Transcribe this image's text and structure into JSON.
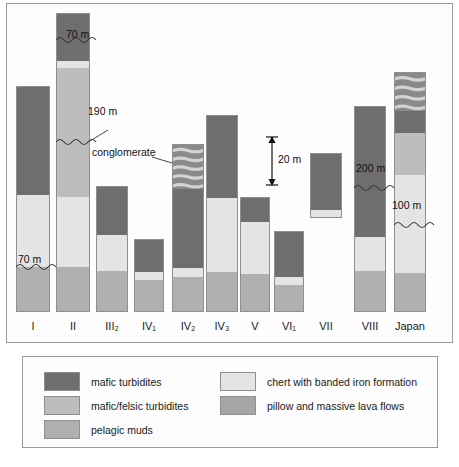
{
  "figure": {
    "type": "stratigraphic-column-diagram",
    "background": "#ffffff",
    "frame_border": "#9a9a9a"
  },
  "colors": {
    "mafic_turbidites": "#6e6e6e",
    "mafic_felsic_turbidites": "#bdbdbd",
    "pelagic_muds": "#b0b0b0",
    "chert_bif": "#e4e4e4",
    "pillow_lava": "#a6a6a6",
    "conglomerate_dark": "#8a8a8a",
    "conglomerate_light": "#d7d7d7",
    "outline": "#8f8f8f",
    "text": "#1a1a1a"
  },
  "legend": {
    "items": [
      {
        "label": "mafic turbidites",
        "color": "#6e6e6e",
        "key": "mafic_turbidites"
      },
      {
        "label": "mafic/felsic turbidites",
        "color": "#bdbdbd",
        "key": "mafic_felsic_turbidites"
      },
      {
        "label": "pelagic muds",
        "color": "#b0b0b0",
        "key": "pelagic_muds"
      },
      {
        "label": "chert with banded iron formation",
        "color": "#e4e4e4",
        "key": "chert_bif"
      },
      {
        "label": "pillow and massive lava flows",
        "color": "#a6a6a6",
        "key": "pillow_lava"
      }
    ]
  },
  "scale": {
    "label": "20 m",
    "value": 20,
    "unit": "m"
  },
  "annotations": [
    {
      "name": "break-70m-column-II",
      "text": "70 m"
    },
    {
      "name": "break-190m-column-II",
      "text": "190 m"
    },
    {
      "name": "conglomerate-callout",
      "text": "conglomerate"
    },
    {
      "name": "break-70m-column-I",
      "text": "70 m"
    },
    {
      "name": "break-200m-column-VIII",
      "text": "200 m"
    },
    {
      "name": "break-100m-column-Japan",
      "text": "100 m"
    }
  ],
  "chart_data": {
    "type": "bar",
    "title": "",
    "xlabel": "",
    "ylabel": "",
    "grid": false,
    "legend_position": "bottom",
    "scale_bar_m": 20,
    "categories": [
      "I",
      "II",
      "III2",
      "IV1",
      "IV2",
      "IV3",
      "V",
      "VI1",
      "VII",
      "VIII",
      "Japan"
    ],
    "category_labels": [
      "I",
      "II",
      "III₂",
      "IV₁",
      "IV₂",
      "IV₃",
      "V",
      "VI₁",
      "VII",
      "VIII",
      "Japan"
    ],
    "columns": [
      {
        "name": "I",
        "label": "I",
        "top_px": 86,
        "bottom_px": 312,
        "segments": [
          {
            "unit": "mafic turbidites",
            "key": "mafic_turbidites",
            "height_px": 108
          },
          {
            "unit": "chert with banded iron formation",
            "key": "chert_bif",
            "height_px": 72
          },
          {
            "unit": "pelagic muds",
            "key": "pelagic_muds",
            "height_px": 46
          }
        ],
        "breaks": [
          {
            "label": "70 m",
            "at_px": 266
          }
        ]
      },
      {
        "name": "II",
        "label": "II",
        "top_px": 13,
        "bottom_px": 312,
        "segments": [
          {
            "unit": "mafic turbidites",
            "key": "mafic_turbidites",
            "height_px": 27
          },
          {
            "unit": "mafic turbidites",
            "key": "mafic_turbidites",
            "height_px": 20
          },
          {
            "unit": "chert with banded iron formation",
            "key": "chert_bif",
            "height_px": 7
          },
          {
            "unit": "mafic/felsic turbidites",
            "key": "mafic_felsic_turbidites",
            "height_px": 73
          },
          {
            "unit": "mafic/felsic turbidites",
            "key": "mafic_felsic_turbidites",
            "height_px": 56
          },
          {
            "unit": "chert with banded iron formation",
            "key": "chert_bif",
            "height_px": 70
          },
          {
            "unit": "pelagic muds",
            "key": "pelagic_muds",
            "height_px": 46
          }
        ],
        "breaks": [
          {
            "label": "70 m",
            "at_px": 40
          },
          {
            "label": "190 m",
            "at_px": 142
          }
        ]
      },
      {
        "name": "III2",
        "label": "III₂",
        "top_px": 186,
        "bottom_px": 312,
        "segments": [
          {
            "unit": "mafic turbidites",
            "key": "mafic_turbidites",
            "height_px": 48
          },
          {
            "unit": "chert with banded iron formation",
            "key": "chert_bif",
            "height_px": 36
          },
          {
            "unit": "pelagic muds",
            "key": "pelagic_muds",
            "height_px": 42
          }
        ],
        "breaks": []
      },
      {
        "name": "IV1",
        "label": "IV₁",
        "top_px": 239,
        "bottom_px": 312,
        "segments": [
          {
            "unit": "mafic turbidites",
            "key": "mafic_turbidites",
            "height_px": 32
          },
          {
            "unit": "chert with banded iron formation",
            "key": "chert_bif",
            "height_px": 8
          },
          {
            "unit": "pelagic muds",
            "key": "pelagic_muds",
            "height_px": 33
          }
        ],
        "breaks": []
      },
      {
        "name": "IV2",
        "label": "IV₂",
        "top_px": 144,
        "bottom_px": 312,
        "segments": [
          {
            "unit": "conglomerate",
            "key": "conglomerate",
            "height_px": 44
          },
          {
            "unit": "mafic turbidites",
            "key": "mafic_turbidites",
            "height_px": 79
          },
          {
            "unit": "chert with banded iron formation",
            "key": "chert_bif",
            "height_px": 9
          },
          {
            "unit": "pelagic muds",
            "key": "pelagic_muds",
            "height_px": 36
          }
        ],
        "breaks": [],
        "callout": "conglomerate"
      },
      {
        "name": "IV3",
        "label": "IV₃",
        "top_px": 115,
        "bottom_px": 312,
        "segments": [
          {
            "unit": "mafic turbidites",
            "key": "mafic_turbidites",
            "height_px": 82
          },
          {
            "unit": "chert with banded iron formation",
            "key": "chert_bif",
            "height_px": 74
          },
          {
            "unit": "pelagic muds",
            "key": "pelagic_muds",
            "height_px": 41
          }
        ],
        "breaks": []
      },
      {
        "name": "V",
        "label": "V",
        "top_px": 197,
        "bottom_px": 312,
        "segments": [
          {
            "unit": "mafic turbidites",
            "key": "mafic_turbidites",
            "height_px": 24
          },
          {
            "unit": "chert with banded iron formation",
            "key": "chert_bif",
            "height_px": 52
          },
          {
            "unit": "pelagic muds",
            "key": "pelagic_muds",
            "height_px": 39
          }
        ],
        "breaks": []
      },
      {
        "name": "VI1",
        "label": "VI₁",
        "top_px": 231,
        "bottom_px": 312,
        "segments": [
          {
            "unit": "mafic turbidites",
            "key": "mafic_turbidites",
            "height_px": 45
          },
          {
            "unit": "chert with banded iron formation",
            "key": "chert_bif",
            "height_px": 8
          },
          {
            "unit": "pelagic muds",
            "key": "pelagic_muds",
            "height_px": 28
          }
        ],
        "breaks": []
      },
      {
        "name": "VII",
        "label": "VII",
        "top_px": 153,
        "bottom_px": 218,
        "segments": [
          {
            "unit": "mafic turbidites",
            "key": "mafic_turbidites",
            "height_px": 56
          },
          {
            "unit": "chert with banded iron formation",
            "key": "chert_bif",
            "height_px": 9
          }
        ],
        "breaks": []
      },
      {
        "name": "VIII",
        "label": "VIII",
        "top_px": 106,
        "bottom_px": 312,
        "segments": [
          {
            "unit": "mafic turbidites",
            "key": "mafic_turbidites",
            "height_px": 72
          },
          {
            "unit": "mafic turbidites",
            "key": "mafic_turbidites",
            "height_px": 58
          },
          {
            "unit": "chert with banded iron formation",
            "key": "chert_bif",
            "height_px": 34
          },
          {
            "unit": "pelagic muds",
            "key": "pelagic_muds",
            "height_px": 42
          }
        ],
        "breaks": [
          {
            "label": "200 m",
            "at_px": 178
          }
        ]
      },
      {
        "name": "Japan",
        "label": "Japan",
        "top_px": 72,
        "bottom_px": 312,
        "segments": [
          {
            "unit": "conglomerate",
            "key": "conglomerate",
            "height_px": 38
          },
          {
            "unit": "mafic turbidites",
            "key": "mafic_turbidites",
            "height_px": 22
          },
          {
            "unit": "mafic/felsic turbidites",
            "key": "mafic_felsic_turbidites",
            "height_px": 42
          },
          {
            "unit": "chert with banded iron formation",
            "key": "chert_bif",
            "height_px": 22
          },
          {
            "unit": "chert with banded iron formation",
            "key": "chert_bif",
            "height_px": 76
          },
          {
            "unit": "pelagic muds",
            "key": "pelagic_muds",
            "height_px": 40
          }
        ],
        "breaks": [
          {
            "label": "100 m",
            "at_px": 216
          }
        ]
      }
    ]
  }
}
